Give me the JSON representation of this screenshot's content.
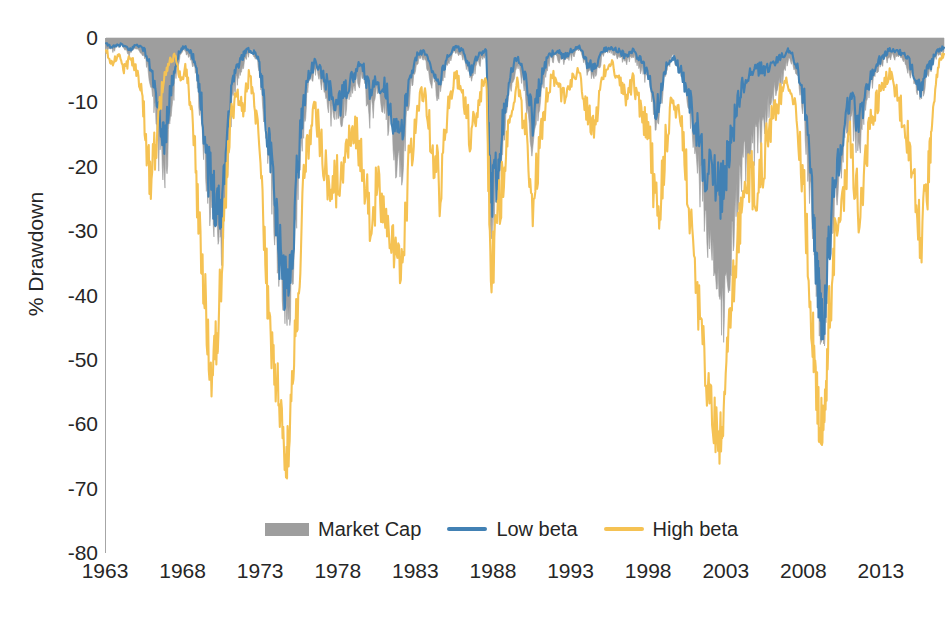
{
  "chart_data": {
    "type": "area",
    "title": "",
    "xlabel": "",
    "ylabel": "% Drawdown",
    "xlim": [
      1963,
      2017
    ],
    "ylim": [
      -80,
      0
    ],
    "xticks": [
      1963,
      1968,
      1973,
      1978,
      1983,
      1988,
      1993,
      1998,
      2003,
      2008,
      2013
    ],
    "yticks": [
      0,
      -10,
      -20,
      -30,
      -40,
      -50,
      -60,
      -70,
      -80
    ],
    "grid": false,
    "legend_position": "bottom-center",
    "colors": {
      "market_cap": "#9e9e9e",
      "low_beta": "#4281b4",
      "high_beta": "#f5c253",
      "axis": "#a6a6a6",
      "text": "#262626"
    },
    "series": [
      {
        "name": "Market Cap",
        "style": "filled-area",
        "color": "#9e9e9e",
        "x": [
          1963.0,
          1963.5,
          1964.0,
          1964.5,
          1965.0,
          1965.5,
          1966.0,
          1966.4,
          1966.8,
          1967.2,
          1967.6,
          1968.0,
          1968.4,
          1968.8,
          1969.2,
          1969.6,
          1970.0,
          1970.4,
          1970.8,
          1971.2,
          1971.6,
          1972.0,
          1972.4,
          1972.8,
          1973.2,
          1973.6,
          1974.0,
          1974.4,
          1974.8,
          1975.2,
          1975.6,
          1976.0,
          1976.5,
          1977.0,
          1977.5,
          1978.0,
          1978.5,
          1979.0,
          1979.5,
          1980.0,
          1980.5,
          1981.0,
          1981.5,
          1982.0,
          1982.5,
          1983.0,
          1983.5,
          1984.0,
          1984.5,
          1985.0,
          1985.5,
          1986.0,
          1986.5,
          1987.0,
          1987.5,
          1987.8,
          1988.2,
          1988.6,
          1989.0,
          1989.5,
          1990.0,
          1990.5,
          1991.0,
          1991.5,
          1992.0,
          1992.5,
          1993.0,
          1993.5,
          1994.0,
          1994.5,
          1995.0,
          1995.5,
          1996.0,
          1996.5,
          1997.0,
          1997.5,
          1998.0,
          1998.5,
          1999.0,
          1999.5,
          2000.0,
          2000.5,
          2001.0,
          2001.5,
          2002.0,
          2002.5,
          2002.8,
          2003.2,
          2003.6,
          2004.0,
          2004.5,
          2005.0,
          2005.5,
          2006.0,
          2006.5,
          2007.0,
          2007.5,
          2008.0,
          2008.5,
          2008.8,
          2009.0,
          2009.3,
          2009.6,
          2010.0,
          2010.5,
          2011.0,
          2011.5,
          2012.0,
          2012.5,
          2013.0,
          2013.5,
          2014.0,
          2014.5,
          2015.0,
          2015.5,
          2016.0,
          2016.5,
          2017.0
        ],
        "values": [
          -1.5,
          -2.0,
          -1.0,
          -2.5,
          -1.5,
          -3.0,
          -8.0,
          -18.0,
          -22.0,
          -12.0,
          -4.0,
          -2.0,
          -3.0,
          -5.0,
          -15.0,
          -26.0,
          -30.0,
          -33.0,
          -20.0,
          -8.0,
          -6.0,
          -3.0,
          -2.0,
          -4.0,
          -12.0,
          -22.0,
          -32.0,
          -40.0,
          -43.0,
          -30.0,
          -16.0,
          -8.0,
          -5.0,
          -8.0,
          -12.0,
          -14.0,
          -10.0,
          -8.0,
          -6.0,
          -12.0,
          -9.0,
          -11.0,
          -17.0,
          -22.0,
          -10.0,
          -4.0,
          -3.0,
          -7.0,
          -9.0,
          -4.0,
          -2.0,
          -3.0,
          -6.0,
          -4.0,
          -3.0,
          -30.0,
          -24.0,
          -16.0,
          -8.0,
          -4.0,
          -8.0,
          -17.0,
          -9.0,
          -4.0,
          -3.0,
          -4.0,
          -3.0,
          -2.0,
          -5.0,
          -6.0,
          -3.0,
          -2.0,
          -3.0,
          -4.0,
          -3.0,
          -5.0,
          -7.0,
          -14.0,
          -6.0,
          -3.0,
          -5.0,
          -10.0,
          -18.0,
          -27.0,
          -33.0,
          -42.0,
          -44.0,
          -36.0,
          -28.0,
          -22.0,
          -18.0,
          -16.0,
          -13.0,
          -9.0,
          -7.0,
          -3.0,
          -5.0,
          -12.0,
          -28.0,
          -38.0,
          -44.0,
          -45.0,
          -33.0,
          -24.0,
          -18.0,
          -12.0,
          -17.0,
          -10.0,
          -6.0,
          -4.0,
          -3.0,
          -3.0,
          -4.0,
          -6.0,
          -9.0,
          -6.0,
          -3.0,
          -2.0
        ]
      },
      {
        "name": "Low beta",
        "style": "line",
        "color": "#4281b4",
        "x": [
          1963.0,
          1963.5,
          1964.0,
          1964.5,
          1965.0,
          1965.5,
          1966.0,
          1966.4,
          1966.8,
          1967.2,
          1967.6,
          1968.0,
          1968.4,
          1968.8,
          1969.2,
          1969.6,
          1970.0,
          1970.4,
          1970.8,
          1971.2,
          1971.6,
          1972.0,
          1972.4,
          1972.8,
          1973.2,
          1973.6,
          1974.0,
          1974.4,
          1974.8,
          1975.2,
          1975.6,
          1976.0,
          1976.5,
          1977.0,
          1977.5,
          1978.0,
          1978.5,
          1979.0,
          1979.5,
          1980.0,
          1980.5,
          1981.0,
          1981.5,
          1982.0,
          1982.5,
          1983.0,
          1983.5,
          1984.0,
          1984.5,
          1985.0,
          1985.5,
          1986.0,
          1986.5,
          1987.0,
          1987.5,
          1987.8,
          1988.2,
          1988.6,
          1989.0,
          1989.5,
          1990.0,
          1990.5,
          1991.0,
          1991.5,
          1992.0,
          1992.5,
          1993.0,
          1993.5,
          1994.0,
          1994.5,
          1995.0,
          1995.5,
          1996.0,
          1996.5,
          1997.0,
          1997.5,
          1998.0,
          1998.5,
          1999.0,
          1999.5,
          2000.0,
          2000.5,
          2001.0,
          2001.5,
          2002.0,
          2002.5,
          2002.8,
          2003.2,
          2003.6,
          2004.0,
          2004.5,
          2005.0,
          2005.5,
          2006.0,
          2006.5,
          2007.0,
          2007.5,
          2008.0,
          2008.5,
          2008.8,
          2009.0,
          2009.3,
          2009.6,
          2010.0,
          2010.5,
          2011.0,
          2011.5,
          2012.0,
          2012.5,
          2013.0,
          2013.5,
          2014.0,
          2014.5,
          2015.0,
          2015.5,
          2016.0,
          2016.5,
          2017.0
        ],
        "values": [
          -1.0,
          -1.5,
          -1.0,
          -2.0,
          -1.0,
          -2.0,
          -6.0,
          -13.0,
          -16.0,
          -8.0,
          -3.0,
          -1.5,
          -2.0,
          -4.0,
          -12.0,
          -21.0,
          -25.0,
          -28.0,
          -15.0,
          -6.0,
          -4.0,
          -2.0,
          -2.0,
          -3.0,
          -10.0,
          -20.0,
          -30.0,
          -38.0,
          -40.0,
          -26.0,
          -13.0,
          -6.0,
          -4.0,
          -6.0,
          -9.0,
          -11.0,
          -8.0,
          -6.0,
          -4.0,
          -9.0,
          -7.0,
          -8.0,
          -13.0,
          -17.0,
          -7.0,
          -3.0,
          -2.0,
          -5.0,
          -7.0,
          -3.0,
          -1.5,
          -2.0,
          -5.0,
          -3.0,
          -2.0,
          -27.0,
          -21.0,
          -13.0,
          -6.0,
          -3.0,
          -6.0,
          -13.0,
          -7.0,
          -3.0,
          -2.0,
          -3.0,
          -2.0,
          -1.5,
          -4.0,
          -5.0,
          -2.0,
          -1.5,
          -2.0,
          -3.0,
          -2.0,
          -4.0,
          -6.0,
          -12.0,
          -5.0,
          -3.0,
          -5.0,
          -9.0,
          -14.0,
          -20.0,
          -22.0,
          -25.0,
          -24.0,
          -17.0,
          -12.0,
          -8.0,
          -6.0,
          -5.0,
          -5.0,
          -4.0,
          -3.0,
          -2.0,
          -4.0,
          -10.0,
          -26.0,
          -37.0,
          -43.0,
          -45.0,
          -32.0,
          -22.0,
          -15.0,
          -9.0,
          -14.0,
          -8.0,
          -5.0,
          -3.0,
          -2.0,
          -2.0,
          -3.0,
          -5.0,
          -8.0,
          -5.0,
          -2.5,
          -1.5
        ]
      },
      {
        "name": "High beta",
        "style": "line",
        "color": "#f5c253",
        "x": [
          1963.0,
          1963.4,
          1963.8,
          1964.2,
          1964.6,
          1965.0,
          1965.4,
          1965.8,
          1966.2,
          1966.6,
          1967.0,
          1967.4,
          1967.8,
          1968.2,
          1968.6,
          1969.0,
          1969.4,
          1969.8,
          1970.2,
          1970.6,
          1971.0,
          1971.4,
          1971.8,
          1972.2,
          1972.6,
          1973.0,
          1973.4,
          1973.8,
          1974.2,
          1974.6,
          1974.9,
          1975.3,
          1975.7,
          1976.1,
          1976.5,
          1977.0,
          1977.5,
          1978.0,
          1978.5,
          1979.0,
          1979.5,
          1980.0,
          1980.5,
          1981.0,
          1981.5,
          1982.0,
          1982.5,
          1983.0,
          1983.5,
          1984.0,
          1984.5,
          1985.0,
          1985.5,
          1986.0,
          1986.5,
          1987.0,
          1987.5,
          1987.8,
          1988.2,
          1988.6,
          1989.0,
          1989.5,
          1990.0,
          1990.5,
          1991.0,
          1991.5,
          1992.0,
          1992.5,
          1993.0,
          1993.5,
          1994.0,
          1994.5,
          1995.0,
          1995.5,
          1996.0,
          1996.5,
          1997.0,
          1997.5,
          1998.0,
          1998.6,
          1999.0,
          1999.5,
          2000.0,
          2000.5,
          2001.0,
          2001.5,
          2002.0,
          2002.5,
          2002.8,
          2003.2,
          2003.6,
          2004.0,
          2004.5,
          2005.0,
          2005.5,
          2006.0,
          2006.5,
          2007.0,
          2007.5,
          2008.0,
          2008.5,
          2008.8,
          2009.0,
          2009.3,
          2009.6,
          2010.0,
          2010.5,
          2011.0,
          2011.5,
          2012.0,
          2012.5,
          2013.0,
          2013.5,
          2014.0,
          2014.5,
          2015.0,
          2015.5,
          2016.0,
          2016.3,
          2016.7,
          2017.0
        ],
        "values": [
          -2.0,
          -4.0,
          -2.5,
          -5.0,
          -3.0,
          -6.0,
          -11.0,
          -23.0,
          -18.0,
          -9.0,
          -4.0,
          -3.0,
          -6.0,
          -5.0,
          -14.0,
          -30.0,
          -42.0,
          -53.0,
          -46.0,
          -30.0,
          -14.0,
          -8.0,
          -12.0,
          -6.0,
          -10.0,
          -24.0,
          -40.0,
          -52.0,
          -58.0,
          -68.0,
          -60.0,
          -44.0,
          -26.0,
          -16.0,
          -12.0,
          -20.0,
          -25.0,
          -23.0,
          -17.0,
          -14.0,
          -20.0,
          -30.0,
          -24.0,
          -28.0,
          -33.0,
          -36.0,
          -22.0,
          -12.0,
          -8.0,
          -18.0,
          -24.0,
          -12.0,
          -6.0,
          -9.0,
          -16.0,
          -10.0,
          -6.0,
          -38.0,
          -30.0,
          -22.0,
          -12.0,
          -8.0,
          -14.0,
          -27.0,
          -16.0,
          -8.0,
          -6.0,
          -10.0,
          -7.0,
          -5.0,
          -12.0,
          -14.0,
          -6.0,
          -4.0,
          -6.0,
          -9.0,
          -7.0,
          -12.0,
          -16.0,
          -31.0,
          -18.0,
          -10.0,
          -12.0,
          -24.0,
          -38.0,
          -50.0,
          -58.0,
          -65.0,
          -60.0,
          -45.0,
          -35.0,
          -26.0,
          -22.0,
          -24.0,
          -18.0,
          -12.0,
          -9.0,
          -7.0,
          -12.0,
          -26.0,
          -45.0,
          -56.0,
          -62.0,
          -60.0,
          -44.0,
          -32.0,
          -24.0,
          -16.0,
          -28.0,
          -18.0,
          -12.0,
          -8.0,
          -6.0,
          -10.0,
          -14.0,
          -20.0,
          -32.0,
          -22.0,
          -10.0,
          -4.0,
          -2.5
        ]
      }
    ]
  },
  "legend": {
    "items": [
      {
        "label": "Market Cap",
        "swatch": "area",
        "color": "#9e9e9e"
      },
      {
        "label": "Low beta",
        "swatch": "line",
        "color": "#4281b4"
      },
      {
        "label": "High beta",
        "swatch": "line",
        "color": "#f5c253"
      }
    ]
  },
  "axes": {
    "y_title": "% Drawdown",
    "y_labels": [
      "0",
      "-10",
      "-20",
      "-30",
      "-40",
      "-50",
      "-60",
      "-70",
      "-80"
    ],
    "x_labels": [
      "1963",
      "1968",
      "1973",
      "1978",
      "1983",
      "1988",
      "1993",
      "1998",
      "2003",
      "2008",
      "2013"
    ]
  }
}
